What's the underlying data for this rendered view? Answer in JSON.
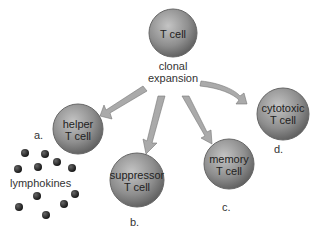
{
  "diagram": {
    "root": {
      "label": "T cell"
    },
    "process_label": [
      "clonal",
      "expansion"
    ],
    "children": [
      {
        "id": "a",
        "label_lines": [
          "helper",
          "T cell"
        ],
        "letter": "a."
      },
      {
        "id": "b",
        "label_lines": [
          "suppressor",
          "T cell"
        ],
        "letter": "b."
      },
      {
        "id": "c",
        "label_lines": [
          "memory",
          "T cell"
        ],
        "letter": "c."
      },
      {
        "id": "d",
        "label_lines": [
          "cytotoxic",
          "T cell"
        ],
        "letter": "d."
      }
    ],
    "secretion_label": "lymphokines",
    "colors": {
      "cell_fill": "#8c8c8c",
      "arrow_fill": "#a8a8a8",
      "dot_fill": "#1a1a1a"
    }
  }
}
